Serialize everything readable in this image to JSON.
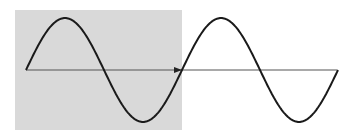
{
  "diagram": {
    "type": "sine-wave",
    "cycles": 2,
    "shaded_region": {
      "label": "first cycle",
      "x": 15,
      "y": 10,
      "width": 167,
      "height": 120,
      "color": "#d9d9d9"
    },
    "axis": {
      "x1": 26,
      "x2": 337,
      "y": 70,
      "color": "#555555",
      "arrow_at_x": 182
    },
    "wave": {
      "x_start": 26,
      "period_px": 156,
      "amplitude_px": 52,
      "baseline_y": 70,
      "color": "#1a1a1a",
      "stroke_width": 2
    },
    "background": "#ffffff"
  }
}
